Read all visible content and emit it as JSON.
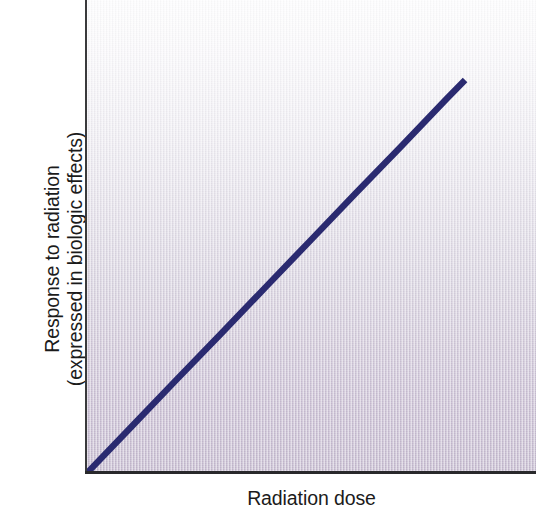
{
  "figure": {
    "kind": "line-graph",
    "outer_background": "#ffffff"
  },
  "axes": {
    "x_label": "Radiation dose",
    "y_label_line1": "Response to radiation",
    "y_label_line2": "(expressed in biologic effects)",
    "axis_color": "#29292b",
    "tick_labels_x": [],
    "tick_labels_y": []
  },
  "plot": {
    "gradient_top_color": "#fdfdfe",
    "gradient_mid_color": "#dcd8e2",
    "gradient_bottom_color": "#c3b8cd",
    "line_color": "#2a2a70",
    "line_width_px": 6
  },
  "chart_data": {
    "type": "line",
    "title": "",
    "subtitle": "",
    "xlabel": "Radiation dose",
    "ylabel": "Response to radiation (expressed in biologic effects)",
    "xlim": [
      0,
      1
    ],
    "ylim": [
      0,
      1
    ],
    "grid": false,
    "legend": null,
    "xticks": [],
    "yticks": [],
    "annotations": [],
    "series": [
      {
        "name": "Linear no-threshold dose-response",
        "color": "#2a2a70",
        "line_width": 6,
        "x": [
          0.0,
          0.1,
          0.2,
          0.3,
          0.4,
          0.5,
          0.6,
          0.7,
          0.8,
          0.842
        ],
        "y": [
          0.0,
          0.099,
          0.198,
          0.296,
          0.395,
          0.494,
          0.593,
          0.691,
          0.79,
          0.831
        ]
      }
    ]
  }
}
